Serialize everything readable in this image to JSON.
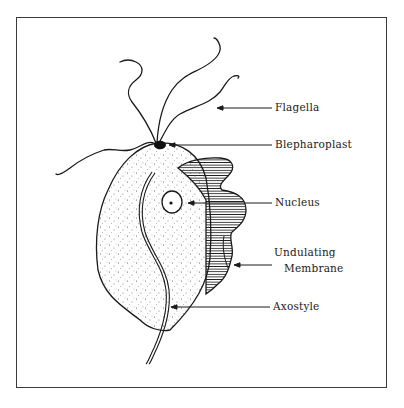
{
  "diagram": {
    "style": "black ink line drawing with stippled cytoplasm and hatched undulating membrane",
    "colors": {
      "ink": "#1a1a1a",
      "background": "#ffffff",
      "frame": "#3a3a3a"
    },
    "labels": {
      "flagella": "Flagella",
      "blepharoplast": "Blepharoplast",
      "nucleus": "Nucleus",
      "undulating_line1": "Undulating",
      "undulating_line2": "Membrane",
      "axostyle": "Axostyle"
    }
  }
}
